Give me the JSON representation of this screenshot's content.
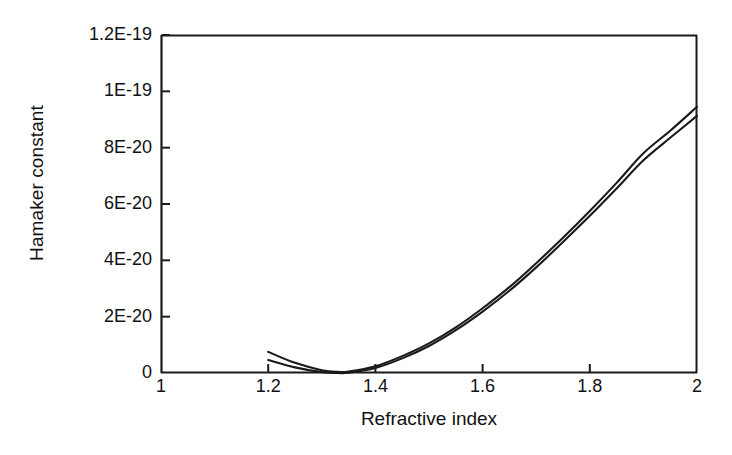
{
  "chart_data": {
    "type": "line",
    "title": "",
    "xlabel": "Refractive index",
    "ylabel": "Hamaker constant",
    "xlim": [
      1,
      2
    ],
    "ylim": [
      0,
      1.2e-19
    ],
    "grid": false,
    "legend": "none",
    "xticks": [
      "1",
      "1.2",
      "1.4",
      "1.6",
      "1.8",
      "2"
    ],
    "xtick_values": [
      1,
      1.2,
      1.4,
      1.6,
      1.8,
      2
    ],
    "yticks": [
      "0",
      "2E-20",
      "4E-20",
      "6E-20",
      "8E-20",
      "1E-19",
      "1.2E-19"
    ],
    "ytick_values": [
      0,
      2e-20,
      4e-20,
      6e-20,
      8e-20,
      1e-19,
      1.2e-19
    ],
    "x": [
      1.2,
      1.25,
      1.3,
      1.33,
      1.35,
      1.4,
      1.45,
      1.5,
      1.55,
      1.6,
      1.65,
      1.7,
      1.75,
      1.8,
      1.85,
      1.9,
      1.95,
      2.0
    ],
    "series": [
      {
        "name": "upper curve",
        "values": [
          7.5e-21,
          3.6e-21,
          1e-21,
          4e-22,
          5e-22,
          2.4e-21,
          6e-21,
          1.05e-20,
          1.62e-20,
          2.3e-20,
          3.05e-20,
          3.9e-20,
          4.8e-20,
          5.75e-20,
          6.75e-20,
          7.8e-20,
          8.6e-20,
          9.45e-20
        ]
      },
      {
        "name": "lower curve",
        "values": [
          4.6e-21,
          2e-21,
          3e-22,
          0.0,
          1e-22,
          1.8e-21,
          5.2e-21,
          9.6e-21,
          1.52e-20,
          2.18e-20,
          2.92e-20,
          3.75e-20,
          4.65e-20,
          5.58e-20,
          6.55e-20,
          7.55e-20,
          8.35e-20,
          9.13e-20
        ]
      }
    ],
    "annotations": []
  }
}
